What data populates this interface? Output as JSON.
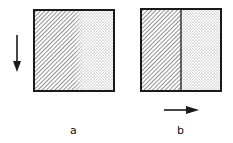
{
  "panels": [
    {
      "id": "a",
      "label": "a",
      "arrow_direction": "down",
      "regions": [
        "hatched",
        "dotted"
      ],
      "boundary": "gradual"
    },
    {
      "id": "b",
      "label": "b",
      "arrow_direction": "right",
      "regions": [
        "hatched",
        "dotted"
      ],
      "boundary": "sharp line"
    }
  ],
  "colors": {
    "stroke": "#1a1a1a",
    "background": "#ffffff"
  }
}
